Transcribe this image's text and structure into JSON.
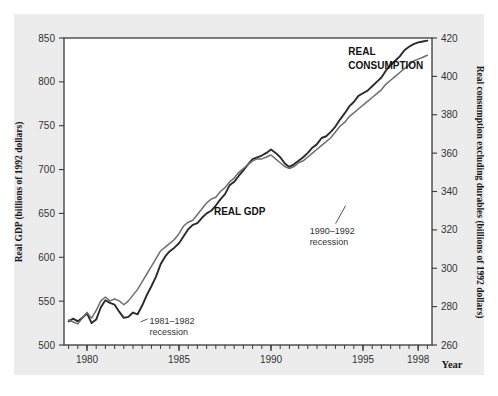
{
  "chart_data": {
    "type": "line",
    "title": "",
    "xlabel": "Year",
    "ylabel": "Real GDP (billions of 1992 dollars)",
    "y2label": "Real consumption excluding durables (billions of 1992 dollars)",
    "grid": false,
    "legend_position": "inline-labels",
    "xlim": [
      1978.75,
      1998.75
    ],
    "ylim": [
      500,
      850
    ],
    "y2lim": [
      260,
      420
    ],
    "xticks": [
      1980,
      1985,
      1990,
      1995,
      1998
    ],
    "xticklabels": [
      "1980",
      "1985",
      "1990",
      "1995",
      "1998"
    ],
    "yticks": [
      500,
      550,
      600,
      650,
      700,
      750,
      800,
      850
    ],
    "yticklabels": [
      "500",
      "550",
      "600",
      "650",
      "700",
      "750",
      "800",
      "850"
    ],
    "y2ticks": [
      260,
      280,
      300,
      320,
      340,
      360,
      380,
      400,
      420
    ],
    "y2ticklabels": [
      "260",
      "280",
      "300",
      "320",
      "340",
      "360",
      "380",
      "400",
      "420"
    ],
    "minor_tick_interval": 0.5,
    "annotations": [
      {
        "id": "rec1",
        "text_line1": "1981–1982",
        "text_line2": "recession",
        "x": 1983.4,
        "y": 524
      },
      {
        "id": "rec2",
        "text_line1": "1990–1992",
        "text_line2": "recession",
        "x": 1992.1,
        "y": 627
      }
    ],
    "series": [
      {
        "name": "REAL GDP",
        "color": "#2b2b2b",
        "axis": "left",
        "label_x": 1986.9,
        "label_y": 648,
        "x": [
          1979.0,
          1979.25,
          1979.5,
          1979.75,
          1980.0,
          1980.25,
          1980.5,
          1980.75,
          1981.0,
          1981.25,
          1981.5,
          1981.75,
          1982.0,
          1982.25,
          1982.5,
          1982.75,
          1983.0,
          1983.25,
          1983.5,
          1983.75,
          1984.0,
          1984.25,
          1984.5,
          1984.75,
          1985.0,
          1985.25,
          1985.5,
          1985.75,
          1986.0,
          1986.25,
          1986.5,
          1986.75,
          1987.0,
          1987.25,
          1987.5,
          1987.75,
          1988.0,
          1988.25,
          1988.5,
          1988.75,
          1989.0,
          1989.25,
          1989.5,
          1989.75,
          1990.0,
          1990.25,
          1990.5,
          1990.75,
          1991.0,
          1991.25,
          1991.5,
          1991.75,
          1992.0,
          1992.25,
          1992.5,
          1992.75,
          1993.0,
          1993.25,
          1993.5,
          1993.75,
          1994.0,
          1994.25,
          1994.5,
          1994.75,
          1995.0,
          1995.25,
          1995.5,
          1995.75,
          1996.0,
          1996.25,
          1996.5,
          1996.75,
          1997.0,
          1997.25,
          1997.5,
          1997.75,
          1998.0,
          1998.25,
          1998.5
        ],
        "y": [
          527,
          530,
          527,
          531,
          536,
          525,
          529,
          543,
          551,
          548,
          546,
          538,
          531,
          532,
          537,
          535,
          545,
          557,
          567,
          578,
          592,
          601,
          607,
          611,
          616,
          624,
          632,
          637,
          639,
          645,
          650,
          653,
          659,
          666,
          672,
          682,
          686,
          693,
          699,
          706,
          712,
          714,
          716,
          719,
          723,
          719,
          714,
          707,
          703,
          706,
          710,
          714,
          719,
          725,
          729,
          736,
          738,
          743,
          749,
          757,
          764,
          772,
          777,
          784,
          787,
          790,
          795,
          800,
          805,
          813,
          819,
          824,
          829,
          836,
          840,
          843,
          845,
          846,
          847
        ]
      },
      {
        "name": "REAL CONSUMPTION",
        "color": "#6e6e6e",
        "axis": "right",
        "label_x": 1994.2,
        "label_y_line1": 411,
        "label_y_line2": 404,
        "x": [
          1979.0,
          1979.25,
          1979.5,
          1979.75,
          1980.0,
          1980.25,
          1980.5,
          1980.75,
          1981.0,
          1981.25,
          1981.5,
          1981.75,
          1982.0,
          1982.25,
          1982.5,
          1982.75,
          1983.0,
          1983.25,
          1983.5,
          1983.75,
          1984.0,
          1984.25,
          1984.5,
          1984.75,
          1985.0,
          1985.25,
          1985.5,
          1985.75,
          1986.0,
          1986.25,
          1986.5,
          1986.75,
          1987.0,
          1987.25,
          1987.5,
          1987.75,
          1988.0,
          1988.25,
          1988.5,
          1988.75,
          1989.0,
          1989.25,
          1989.5,
          1989.75,
          1990.0,
          1990.25,
          1990.5,
          1990.75,
          1991.0,
          1991.25,
          1991.5,
          1991.75,
          1992.0,
          1992.25,
          1992.5,
          1992.75,
          1993.0,
          1993.25,
          1993.5,
          1993.75,
          1994.0,
          1994.25,
          1994.5,
          1994.75,
          1995.0,
          1995.25,
          1995.5,
          1995.75,
          1996.0,
          1996.25,
          1996.5,
          1996.75,
          1997.0,
          1997.25,
          1997.5,
          1997.75,
          1998.0,
          1998.25,
          1998.5
        ],
        "y": [
          273,
          272,
          271,
          274,
          277,
          274,
          278,
          283,
          285,
          283,
          284,
          283,
          281,
          283,
          286,
          289,
          293,
          297,
          301,
          305,
          309,
          311,
          313,
          315,
          318,
          322,
          324,
          325,
          328,
          331,
          334,
          336,
          337,
          340,
          342,
          345,
          347,
          350,
          352,
          354,
          356,
          357,
          357,
          358,
          359,
          357,
          355,
          353,
          352,
          353,
          355,
          356,
          358,
          360,
          362,
          364,
          366,
          368,
          371,
          374,
          376,
          379,
          381,
          383,
          385,
          387,
          389,
          391,
          393,
          396,
          398,
          400,
          402,
          404,
          406,
          408,
          409,
          410,
          411
        ]
      }
    ]
  },
  "axes": {
    "left_title": "Real GDP (billions of 1992 dollars)",
    "right_title": "Real consumption excluding durables (billions of 1992 dollars)",
    "x_title": "Year"
  },
  "colors": {
    "panel_background": "#ececec",
    "plot_background": "#ffffff",
    "frame": "#3a3a3a",
    "gdp_line": "#2b2b2b",
    "consumption_line": "#6e6e6e",
    "text": "#333333"
  }
}
